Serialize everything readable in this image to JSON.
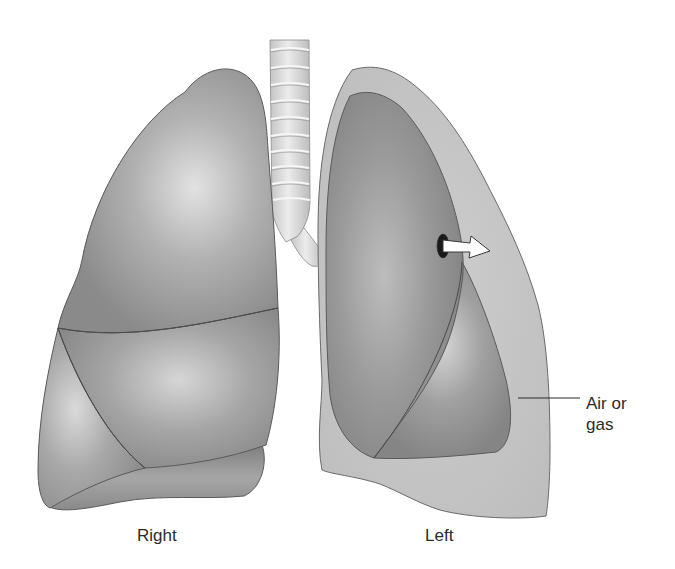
{
  "figure": {
    "labels": {
      "right_lung": "Right",
      "left_lung": "Left",
      "air_or_gas_line1": "Air or",
      "air_or_gas_line2": "gas"
    },
    "parts": [
      {
        "id": "right-lung",
        "description": "Normal inflated right lung with three lobes"
      },
      {
        "id": "trachea",
        "description": "Trachea with cartilage rings branching into bronchi"
      },
      {
        "id": "left-lung-pleural-space",
        "description": "Pleural cavity filled with air or gas"
      },
      {
        "id": "collapsed-left-lung",
        "description": "Collapsed left lung with two lobes"
      },
      {
        "id": "puncture-hole",
        "description": "Hole in lung surface"
      },
      {
        "id": "air-leak-arrow",
        "description": "Arrow showing air escaping into pleural space"
      }
    ],
    "colors": {
      "background": "#ffffff",
      "lung_fill": "#9a9a9a",
      "lung_highlight": "#dcdcdc",
      "lung_outline": "#5a5a5a",
      "pleural_space_fill": "#c4c4c4",
      "trachea_fill": "#d9d9d9",
      "trachea_ring": "#f2f2f2",
      "hole": "#1a1a1a",
      "arrow_fill": "#ffffff",
      "text": "#2b2b2b"
    }
  }
}
